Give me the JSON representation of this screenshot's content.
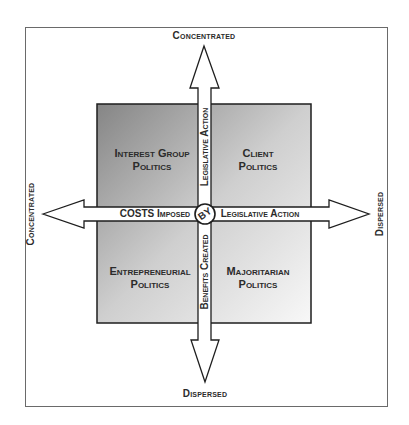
{
  "diagram": {
    "type": "quadrant-matrix",
    "axes": {
      "vertical": {
        "top_label": "Concentrated",
        "bottom_label": "Dispersed",
        "arrow_upper_text": "Legislative Action",
        "arrow_lower_text": "Benefits Created"
      },
      "horizontal": {
        "left_label": "Concentrated",
        "right_label": "Dispersed",
        "arrow_left_text": "COSTS Imposed",
        "arrow_right_text": "Legislative Action"
      },
      "center_badge": "BY"
    },
    "quadrants": {
      "top_left": {
        "line1": "Interest Group",
        "line2": "Politics"
      },
      "top_right": {
        "line1": "Client",
        "line2": "Politics"
      },
      "bottom_left": {
        "line1": "Entrepreneurial",
        "line2": "Politics"
      },
      "bottom_right": {
        "line1": "Majoritarian",
        "line2": "Politics"
      }
    },
    "colors": {
      "gradient_dark": "#8a8a8a",
      "gradient_light": "#f7f7f7",
      "stroke": "#1e1e1e",
      "text": "#2b2b2b",
      "frame": "#6a6a6a"
    }
  }
}
